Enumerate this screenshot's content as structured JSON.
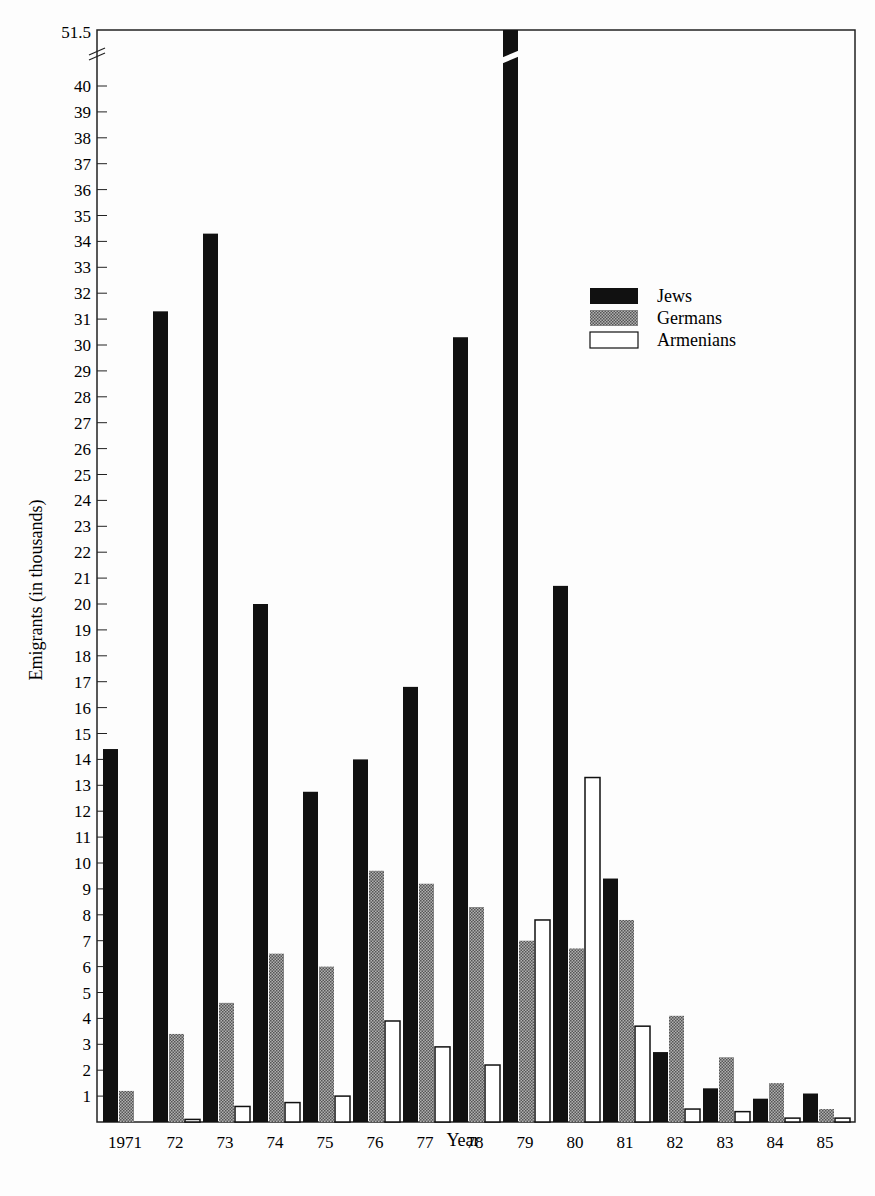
{
  "chart_data": {
    "type": "bar",
    "title": "",
    "xlabel": "Year",
    "ylabel": "Emigrants (in thousands)",
    "categories": [
      "1971",
      "72",
      "73",
      "74",
      "75",
      "76",
      "77",
      "78",
      "79",
      "80",
      "81",
      "82",
      "83",
      "84",
      "85"
    ],
    "series": [
      {
        "name": "Jews",
        "color": "#111111",
        "values": [
          14.4,
          31.3,
          34.3,
          20.0,
          12.75,
          14.0,
          16.8,
          30.3,
          51.5,
          20.7,
          9.4,
          2.7,
          1.3,
          0.9,
          1.1
        ]
      },
      {
        "name": "Germans",
        "color": "#8a8a8a",
        "values": [
          1.2,
          3.4,
          4.6,
          6.5,
          6.0,
          9.7,
          9.2,
          8.3,
          7.0,
          6.7,
          7.8,
          4.1,
          2.5,
          1.5,
          0.5
        ]
      },
      {
        "name": "Armenians",
        "color": "#ffffff",
        "values": [
          0.0,
          0.1,
          0.6,
          0.75,
          1.0,
          3.9,
          2.9,
          2.2,
          7.8,
          13.3,
          3.7,
          0.5,
          0.4,
          0.15,
          0.15
        ]
      }
    ],
    "yticks": [
      "1",
      "2",
      "3",
      "4",
      "5",
      "6",
      "7",
      "8",
      "9",
      "10",
      "11",
      "12",
      "13",
      "14",
      "15",
      "16",
      "17",
      "18",
      "19",
      "20",
      "21",
      "22",
      "23",
      "24",
      "25",
      "26",
      "27",
      "28",
      "29",
      "30",
      "31",
      "32",
      "33",
      "34",
      "35",
      "36",
      "37",
      "38",
      "39",
      "40"
    ],
    "ytop_label": "51.5",
    "axis_break": true,
    "ylim": [
      0,
      51.5
    ],
    "grid": false,
    "legend_position": "upper right"
  },
  "legend": {
    "items": [
      {
        "label": "Jews"
      },
      {
        "label": "Germans"
      },
      {
        "label": "Armenians"
      }
    ]
  }
}
